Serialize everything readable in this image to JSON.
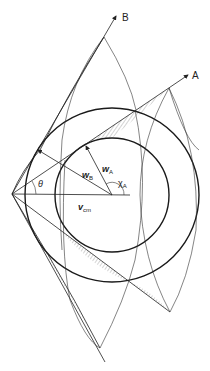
{
  "figure": {
    "type": "velocity-vector (Newton) diagram",
    "labels": {
      "line_a": "A",
      "line_b": "B",
      "w_a": "w",
      "w_a_sub": "A",
      "w_b": "w",
      "w_b_sub": "B",
      "chi_a": "χ",
      "chi_a_sub": "A",
      "v_cm": "v",
      "v_cm_sub": "cm",
      "theta": "θ"
    },
    "geometry": {
      "origin": [
        12,
        194
      ],
      "center": [
        112,
        195
      ],
      "inner_circle_radius": 57,
      "outer_circle_radius": 87,
      "arrow_b_tip": [
        116,
        16
      ],
      "arrow_a_tip": [
        188,
        75
      ]
    },
    "colors": {
      "line": "#222222",
      "background": "#ffffff"
    }
  }
}
